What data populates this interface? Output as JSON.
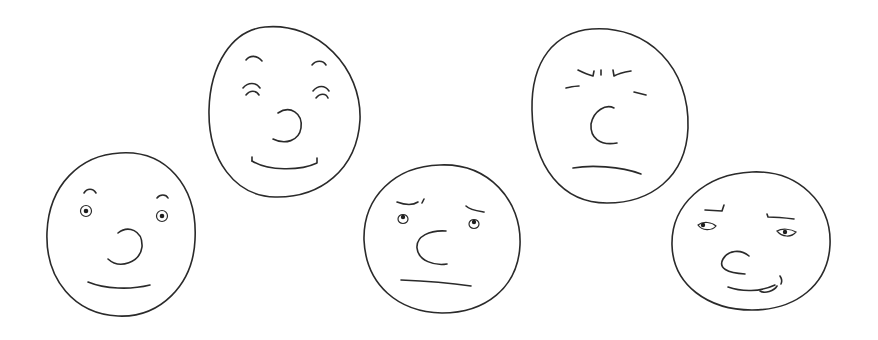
{
  "image": {
    "description": "Five hand-drawn cartoon faces showing different expressions on a white background",
    "background_color": "#ffffff",
    "stroke_color": "#2a2a2a"
  },
  "faces": [
    {
      "id": "face-1",
      "expression": "surprised-smile",
      "position": "bottom-left"
    },
    {
      "id": "face-2",
      "expression": "happy-eyes-closed",
      "position": "top-left-center"
    },
    {
      "id": "face-3",
      "expression": "skeptical",
      "position": "bottom-center"
    },
    {
      "id": "face-4",
      "expression": "angry-squint",
      "position": "top-right-center"
    },
    {
      "id": "face-5",
      "expression": "smug-tongue-out",
      "position": "bottom-right"
    }
  ]
}
